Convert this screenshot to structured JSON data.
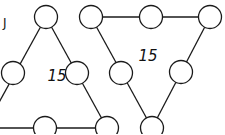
{
  "diagram": {
    "stroke_color": "#1a1a1a",
    "background": "#ffffff",
    "fragment_text": "J",
    "triangles": [
      {
        "id": "left",
        "orientation": "up",
        "sum_label": "15",
        "label_pos": [
          57,
          81
        ],
        "nodes": [
          {
            "id": "L-top",
            "x": 46,
            "y": 17
          },
          {
            "id": "L-mid-left",
            "x": 13,
            "y": 73
          },
          {
            "id": "L-mid-right",
            "x": 77,
            "y": 73
          },
          {
            "id": "L-bot-left",
            "x": -15,
            "y": 128
          },
          {
            "id": "L-bot-mid",
            "x": 45,
            "y": 128
          },
          {
            "id": "L-bot-right",
            "x": 107,
            "y": 128
          }
        ]
      },
      {
        "id": "right",
        "orientation": "down",
        "sum_label": "15",
        "label_pos": [
          148,
          61
        ],
        "nodes": [
          {
            "id": "R-top-left",
            "x": 91,
            "y": 17
          },
          {
            "id": "R-top-mid",
            "x": 151,
            "y": 17
          },
          {
            "id": "R-top-right",
            "x": 210,
            "y": 17
          },
          {
            "id": "R-mid-left",
            "x": 121,
            "y": 73
          },
          {
            "id": "R-mid-right",
            "x": 181,
            "y": 72
          },
          {
            "id": "R-bot",
            "x": 152,
            "y": 128
          }
        ]
      }
    ]
  }
}
